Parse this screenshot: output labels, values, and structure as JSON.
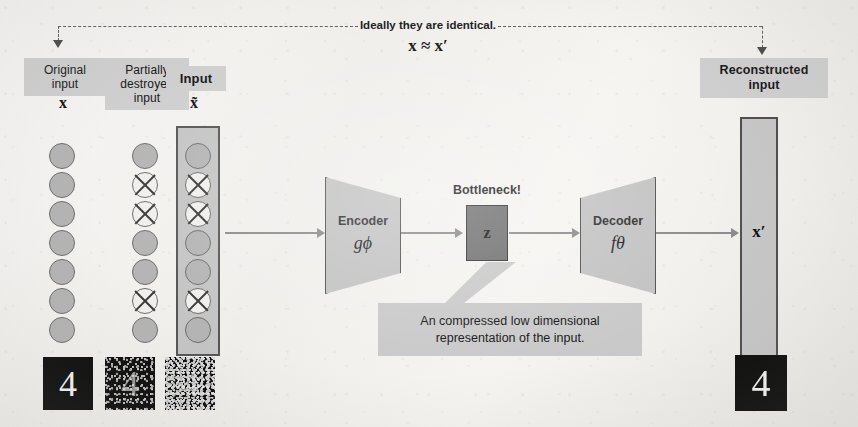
{
  "diagram": {
    "top_note": {
      "text": "Ideally they are identical.",
      "equation": "x ≈ x′"
    },
    "columns": [
      {
        "id": "original-input",
        "chip_label": "Original\ninput",
        "chip_bold": false,
        "symbol": "x",
        "nodes": [
          {
            "destroyed": false
          },
          {
            "destroyed": false
          },
          {
            "destroyed": false
          },
          {
            "destroyed": false
          },
          {
            "destroyed": false
          },
          {
            "destroyed": false
          },
          {
            "destroyed": false
          }
        ]
      },
      {
        "id": "partially-destroyed-input",
        "chip_label": "Partially\ndestroyed\ninput",
        "chip_bold": false,
        "symbol": "",
        "nodes": [
          {
            "destroyed": false
          },
          {
            "destroyed": true
          },
          {
            "destroyed": true
          },
          {
            "destroyed": false
          },
          {
            "destroyed": false
          },
          {
            "destroyed": true
          },
          {
            "destroyed": false
          }
        ]
      },
      {
        "id": "input",
        "chip_label": "Input",
        "chip_bold": true,
        "symbol": "x̃",
        "nodes": [
          {
            "destroyed": false
          },
          {
            "destroyed": true
          },
          {
            "destroyed": true
          },
          {
            "destroyed": false
          },
          {
            "destroyed": false
          },
          {
            "destroyed": true
          },
          {
            "destroyed": false
          }
        ]
      }
    ],
    "encoder": {
      "label": "Encoder",
      "function": "gϕ"
    },
    "bottleneck": {
      "title": "Bottleneck!",
      "symbol": "z"
    },
    "decoder": {
      "label": "Decoder",
      "function": "fθ"
    },
    "reconstructed": {
      "chip_label": "Reconstructed\ninput",
      "symbol": "x′"
    },
    "annotation": {
      "line1": "An compressed low dimensional",
      "line2": "representation of the input."
    },
    "digits": [
      {
        "id": "digit-original",
        "glyph": "4",
        "noise": "none",
        "caption": ""
      },
      {
        "id": "digit-noisy",
        "glyph": "4",
        "noise": "mid",
        "caption": ""
      },
      {
        "id": "digit-very-noisy",
        "glyph": "4",
        "noise": "heavy",
        "caption": ""
      },
      {
        "id": "digit-reconstructed",
        "glyph": "4",
        "noise": "none",
        "caption": ""
      }
    ],
    "colors": {
      "chip_fill": "#cfcfcf",
      "node_fill": "#b4b4b4",
      "node_stroke": "#6d6d6d",
      "trapezoid_fill": "#c2c2c2",
      "bottleneck_fill": "#6e6e6e",
      "annotation_fill": "#c9c9c9",
      "arrow": "#8a8a8a",
      "dashed": "#5f5f5f",
      "digit_bg": "#0b0b0b",
      "background": "#f3f2ef"
    }
  }
}
